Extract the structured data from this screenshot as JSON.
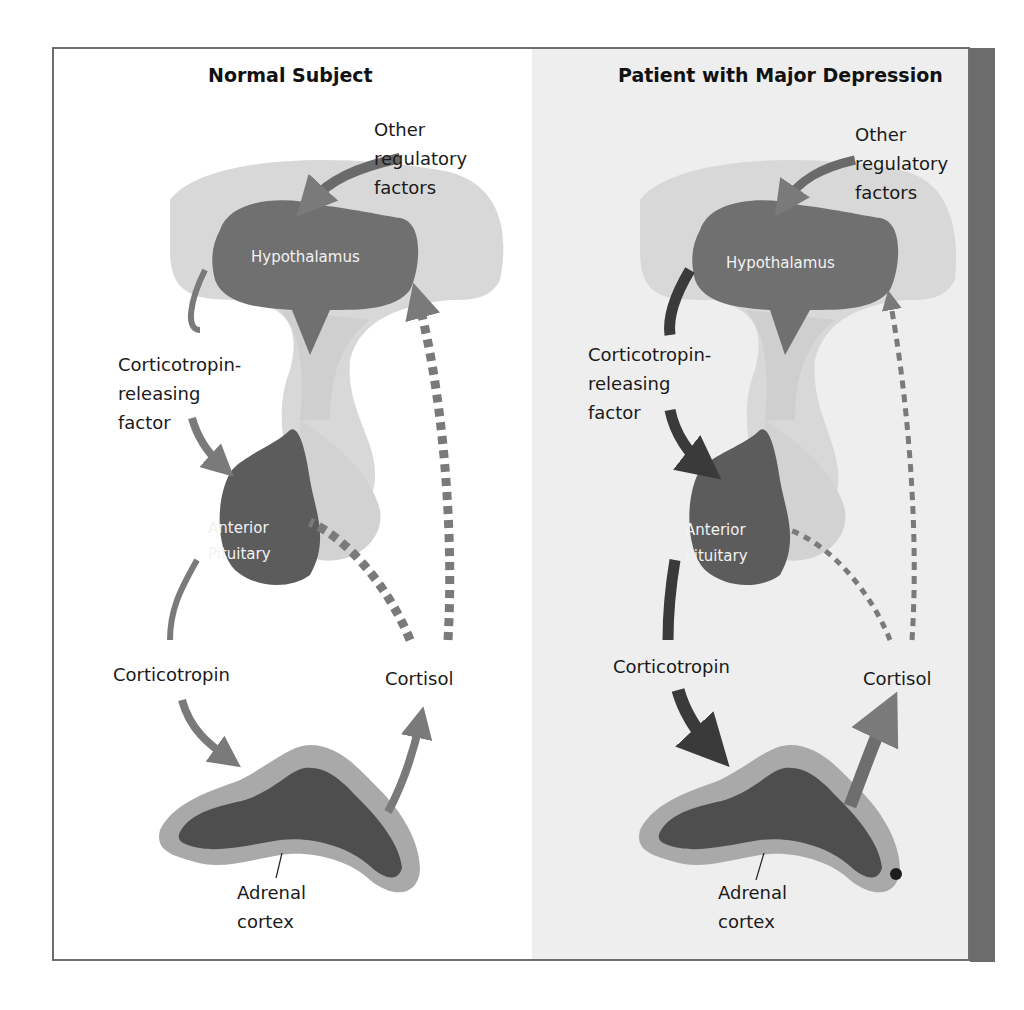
{
  "figure": {
    "panels": [
      {
        "id": "normal",
        "title": "Normal Subject",
        "labels": {
          "other_factors": "Other\nregulatory\nfactors",
          "hypothalamus": "Hypothalamus",
          "crf": "Corticotropin-\nreleasing\nfactor",
          "anterior_pituitary": "Anterior\nPituitary",
          "corticotropin": "Corticotropin",
          "cortisol": "Cortisol",
          "adrenal_cortex": "Adrenal\ncortex"
        },
        "arrows": {
          "crf": "medium",
          "corticotropin": "medium",
          "cortisol_release": "medium",
          "cortisol_feedback": "thick-dashed"
        }
      },
      {
        "id": "depression",
        "title": "Patient with Major Depression",
        "labels": {
          "other_factors": "Other\nregulatory\nfactors",
          "hypothalamus": "Hypothalamus",
          "crf": "Corticotropin-\nreleasing\nfactor",
          "anterior_pituitary": "Anterior\nPituitary",
          "corticotropin": "Corticotropin",
          "cortisol": "Cortisol",
          "adrenal_cortex": "Adrenal\ncortex"
        },
        "arrows": {
          "crf": "thick-dark",
          "corticotropin": "thick-dark",
          "cortisol_release": "thick",
          "cortisol_feedback": "thin-dashed"
        }
      }
    ],
    "colors": {
      "organ": "#707070",
      "organ_dark": "#5a5a5a",
      "arrow": "#7a7a7a",
      "arrow_dark": "#3a3a3a",
      "brain_tissue": "#d6d6d6",
      "adrenal_outer": "#a9a9a9",
      "adrenal_inner": "#4e4e4e",
      "frame": "#6e6e6e",
      "right_panel_bg": "#eeeeee"
    }
  }
}
